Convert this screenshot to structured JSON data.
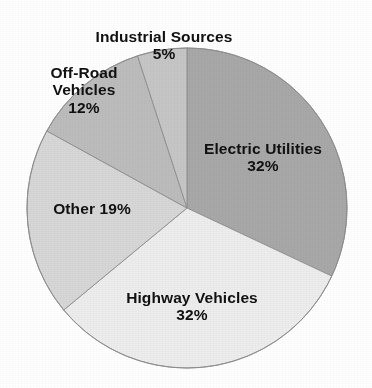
{
  "chart_data": {
    "type": "pie",
    "title": "",
    "subtitle": "",
    "xlabel": "",
    "ylabel": "",
    "legend_position": "none",
    "grid": false,
    "labels_inline": true,
    "start_angle_deg": 0,
    "direction": "clockwise",
    "units": "percent",
    "categories": [
      "Electric Utilities",
      "Highway Vehicles",
      "Other",
      "Off-Road Vehicles",
      "Industrial Sources"
    ],
    "values": [
      32,
      32,
      19,
      12,
      5
    ],
    "slices": [
      {
        "name": "Electric Utilities",
        "value": 32,
        "value_text": "32%",
        "label_text": "Electric Utilities\n32%",
        "color": "#a8a8a8"
      },
      {
        "name": "Highway Vehicles",
        "value": 32,
        "value_text": "32%",
        "label_text": "Highway Vehicles\n32%",
        "color": "#ededed"
      },
      {
        "name": "Other",
        "value": 19,
        "value_text": "19%",
        "label_text": "Other 19%",
        "color": "#d7d7d7"
      },
      {
        "name": "Off-Road Vehicles",
        "value": 12,
        "value_text": "12%",
        "label_text": "Off-Road\nVehicles\n12%",
        "color": "#bcbcbc"
      },
      {
        "name": "Industrial Sources",
        "value": 5,
        "value_text": "5%",
        "label_text": "Industrial Sources\n5%",
        "color": "#c6c6c6"
      }
    ],
    "geometry": {
      "center_x": 187,
      "center_y": 208,
      "radius": 160
    },
    "colors": {
      "outline": "#8f8f8f",
      "text": "#111111",
      "background": "#ffffff"
    }
  }
}
